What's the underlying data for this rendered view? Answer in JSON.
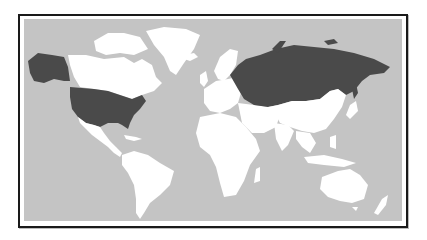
{
  "map": {
    "type": "world-choropleth",
    "projection": "equirectangular-like",
    "colors": {
      "ocean": "#c4c4c4",
      "land_default": "#ffffff",
      "highlighted": "#4a4a4a",
      "borders": "#bdbdbd",
      "frame": "#1a1a1a"
    },
    "highlighted_regions": [
      "United States (incl. Alaska)",
      "Russia"
    ],
    "unhighlighted_regions": [
      "Canada",
      "Greenland",
      "Mexico",
      "Central America",
      "South America",
      "Europe",
      "Africa",
      "Middle East",
      "Central Asia",
      "China",
      "India",
      "Southeast Asia",
      "Japan",
      "Australia",
      "New Zealand"
    ]
  }
}
